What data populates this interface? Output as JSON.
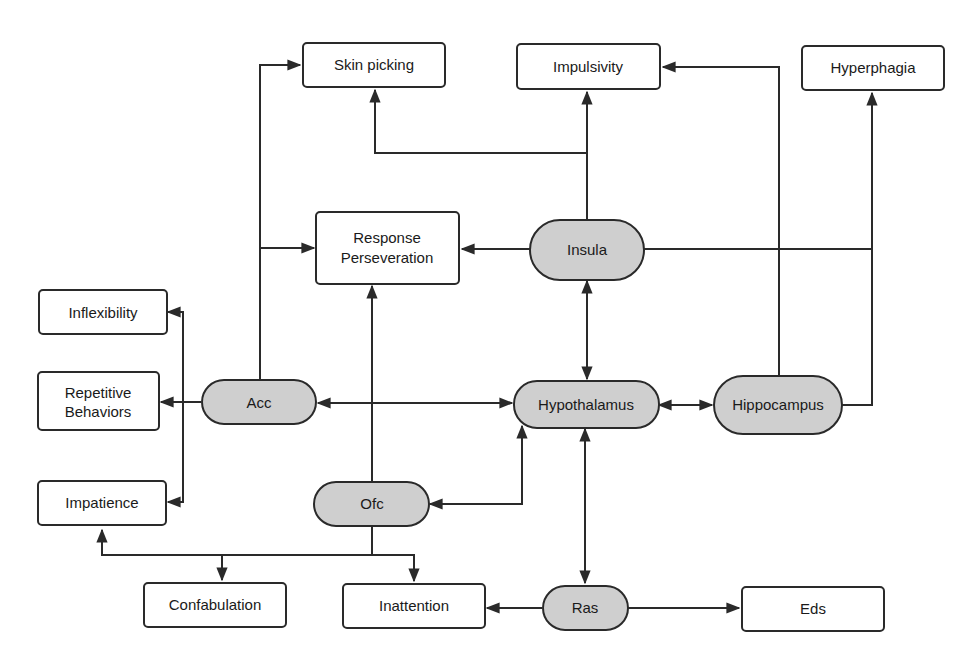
{
  "diagram": {
    "colors": {
      "line": "#2a2a2a",
      "region_fill": "#cfcfcf",
      "outcome_fill": "#ffffff"
    },
    "regions": {
      "insula": "Insula",
      "acc": "Acc",
      "hypothalamus": "Hypothalamus",
      "hippocampus": "Hippocampus",
      "ofc": "Ofc",
      "ras": "Ras"
    },
    "outcomes": {
      "skin_picking": "Skin picking",
      "impulsivity": "Impulsivity",
      "hyperphagia": "Hyperphagia",
      "response_perseveration_line1": "Response",
      "response_perseveration_line2": "Perseveration",
      "inflexibility": "Inflexibility",
      "repetitive_behaviors_line1": "Repetitive",
      "repetitive_behaviors_line2": "Behaviors",
      "impatience": "Impatience",
      "confabulation": "Confabulation",
      "inattention": "Inattention",
      "eds": "Eds"
    },
    "edges": [
      {
        "from": "Acc",
        "to": "Skin picking"
      },
      {
        "from": "Acc",
        "to": "Response Perseveration"
      },
      {
        "from": "Acc",
        "to": "Inflexibility"
      },
      {
        "from": "Acc",
        "to": "Repetitive Behaviors"
      },
      {
        "from": "Acc",
        "to": "Impatience"
      },
      {
        "from": "Acc",
        "to": "Hypothalamus",
        "bidirectional": true
      },
      {
        "from": "Insula",
        "to": "Skin picking"
      },
      {
        "from": "Insula",
        "to": "Impulsivity"
      },
      {
        "from": "Insula",
        "to": "Response Perseveration"
      },
      {
        "from": "Insula",
        "to": "Hyperphagia"
      },
      {
        "from": "Insula",
        "to": "Hypothalamus",
        "bidirectional": true
      },
      {
        "from": "Hippocampus",
        "to": "Impulsivity"
      },
      {
        "from": "Hippocampus",
        "to": "Hyperphagia"
      },
      {
        "from": "Hypothalamus",
        "to": "Hippocampus",
        "bidirectional": true
      },
      {
        "from": "Ofc",
        "to": "Response Perseveration"
      },
      {
        "from": "Ofc",
        "to": "Hypothalamus",
        "bidirectional": true
      },
      {
        "from": "Ofc",
        "to": "Impatience"
      },
      {
        "from": "Ofc",
        "to": "Confabulation"
      },
      {
        "from": "Ofc",
        "to": "Inattention"
      },
      {
        "from": "Hypothalamus",
        "to": "Ras",
        "bidirectional": true
      },
      {
        "from": "Ras",
        "to": "Inattention"
      },
      {
        "from": "Ras",
        "to": "Eds"
      }
    ]
  }
}
